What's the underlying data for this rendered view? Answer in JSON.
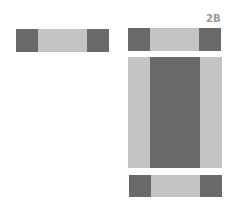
{
  "label": "2B",
  "colors": {
    "dark": "#6a6a6a",
    "light": "#c4c4c4",
    "label": "#9a9a9a"
  },
  "shapes": [
    {
      "name": "left-bar",
      "segments": [
        "dark",
        "light",
        "dark"
      ]
    },
    {
      "name": "right-top-bar",
      "segments": [
        "dark",
        "light",
        "dark"
      ]
    },
    {
      "name": "right-center-block",
      "segments": [
        "light",
        "dark",
        "light"
      ]
    },
    {
      "name": "right-bottom-bar",
      "segments": [
        "dark",
        "light",
        "dark"
      ]
    }
  ]
}
